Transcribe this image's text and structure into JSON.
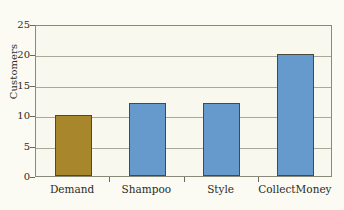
{
  "chart_data": {
    "type": "bar",
    "title": "",
    "xlabel": "",
    "ylabel": "Customers",
    "categories": [
      "Demand",
      "Shampoo",
      "Style",
      "CollectMoney"
    ],
    "values": [
      10,
      12,
      12,
      20
    ],
    "ylim": [
      0,
      25
    ],
    "yticks": [
      0,
      5,
      10,
      15,
      20,
      25
    ],
    "ytick_labels": [
      "0",
      "5",
      "10",
      "15",
      "20",
      "25"
    ],
    "grid": true,
    "legend": false,
    "bar_colors": [
      "#a8862c",
      "#6699cc",
      "#6699cc",
      "#6699cc"
    ],
    "series": [
      {
        "name": "Customers",
        "values": [
          10,
          12,
          12,
          20
        ]
      }
    ]
  },
  "figure": {
    "background_color": "#fbfbf3",
    "plot_background_color": "#f8f8ee",
    "frame_color": "#8a8a7a",
    "gridline_color": "#a9a99a",
    "bar_outline_color": "#4a4a3c",
    "accent_gold": "#a8862c",
    "accent_blue": "#6699cc",
    "caption_remnant": ""
  }
}
